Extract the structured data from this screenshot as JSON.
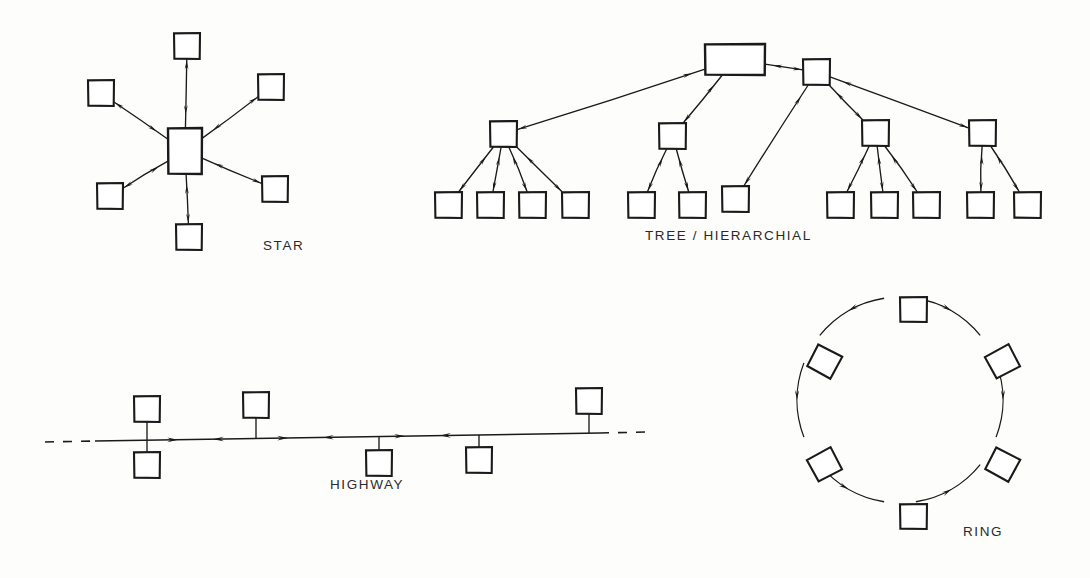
{
  "page": {
    "background_color": "#fdfdfc",
    "ink_color": "#1a1a1a",
    "width": 1090,
    "height": 578,
    "style": "hand-drawn technical line diagram, black ink on white"
  },
  "diagrams": [
    {
      "id": "star",
      "caption": "STAR",
      "caption_x": 263,
      "caption_y": 238,
      "hub": {
        "x": 168,
        "y": 128,
        "w": 34,
        "h": 46,
        "shape": "rectangle"
      },
      "spoke_count": 6,
      "link_style": "bidirectional",
      "nodes": [
        {
          "name": "star-node-top",
          "x": 174,
          "y": 33,
          "w": 26,
          "h": 26
        },
        {
          "name": "star-node-upper-left",
          "x": 88,
          "y": 80,
          "w": 26,
          "h": 26
        },
        {
          "name": "star-node-upper-right",
          "x": 258,
          "y": 74,
          "w": 26,
          "h": 26
        },
        {
          "name": "star-node-lower-left",
          "x": 97,
          "y": 183,
          "w": 26,
          "h": 26
        },
        {
          "name": "star-node-lower-right",
          "x": 262,
          "y": 176,
          "w": 26,
          "h": 26
        },
        {
          "name": "star-node-bottom",
          "x": 176,
          "y": 224,
          "w": 26,
          "h": 26
        }
      ]
    },
    {
      "id": "tree",
      "caption": "TREE / HIERARCHIAL",
      "caption_x": 645,
      "caption_y": 228,
      "link_style": "bidirectional",
      "root": {
        "name": "tree-root",
        "x": 705,
        "y": 44,
        "w": 60,
        "h": 31,
        "shape": "rectangle"
      },
      "subroot": {
        "name": "tree-subroot",
        "x": 803,
        "y": 59,
        "w": 27,
        "h": 26
      },
      "branches": [
        {
          "name": "tree-branch-1",
          "x": 490,
          "y": 121,
          "w": 27,
          "h": 26,
          "parent": "tree-root",
          "leaf_count": 4
        },
        {
          "name": "tree-branch-2",
          "x": 659,
          "y": 123,
          "w": 27,
          "h": 26,
          "parent": "tree-root",
          "leaf_count": 2
        },
        {
          "name": "tree-branch-3",
          "x": 862,
          "y": 120,
          "w": 27,
          "h": 26,
          "parent": "tree-subroot",
          "leaf_count": 3
        },
        {
          "name": "tree-branch-4",
          "x": 969,
          "y": 120,
          "w": 27,
          "h": 26,
          "parent": "tree-subroot",
          "leaf_count": 2
        }
      ],
      "direct_leaf": {
        "name": "tree-direct-leaf",
        "x": 722,
        "y": 186,
        "w": 27,
        "h": 26,
        "parent": "tree-subroot"
      },
      "leaves": [
        {
          "name": "tree-leaf-1",
          "x": 435,
          "y": 192,
          "w": 27,
          "h": 26,
          "parent": "tree-branch-1"
        },
        {
          "name": "tree-leaf-2",
          "x": 477,
          "y": 192,
          "w": 27,
          "h": 26,
          "parent": "tree-branch-1"
        },
        {
          "name": "tree-leaf-3",
          "x": 519,
          "y": 192,
          "w": 27,
          "h": 26,
          "parent": "tree-branch-1"
        },
        {
          "name": "tree-leaf-4",
          "x": 562,
          "y": 192,
          "w": 27,
          "h": 26,
          "parent": "tree-branch-1"
        },
        {
          "name": "tree-leaf-5",
          "x": 628,
          "y": 192,
          "w": 27,
          "h": 26,
          "parent": "tree-branch-2"
        },
        {
          "name": "tree-leaf-6",
          "x": 679,
          "y": 192,
          "w": 27,
          "h": 26,
          "parent": "tree-branch-2"
        },
        {
          "name": "tree-leaf-7",
          "x": 827,
          "y": 192,
          "w": 27,
          "h": 26,
          "parent": "tree-branch-3"
        },
        {
          "name": "tree-leaf-8",
          "x": 871,
          "y": 192,
          "w": 27,
          "h": 26,
          "parent": "tree-branch-3"
        },
        {
          "name": "tree-leaf-9",
          "x": 913,
          "y": 192,
          "w": 27,
          "h": 26,
          "parent": "tree-branch-3"
        },
        {
          "name": "tree-leaf-10",
          "x": 967,
          "y": 192,
          "w": 27,
          "h": 26,
          "parent": "tree-branch-4"
        },
        {
          "name": "tree-leaf-11",
          "x": 1014,
          "y": 192,
          "w": 27,
          "h": 26,
          "parent": "tree-branch-4"
        }
      ]
    },
    {
      "id": "highway",
      "caption": "HIGHWAY",
      "caption_x": 330,
      "caption_y": 477,
      "link_style": "bidirectional",
      "bus": {
        "x1": 95,
        "y1": 441,
        "x2": 600,
        "y2": 433
      },
      "dash_left": {
        "x1": 45,
        "y1": 442,
        "x2": 96,
        "y2": 441
      },
      "dash_right": {
        "x1": 600,
        "y1": 433,
        "x2": 648,
        "y2": 432
      },
      "taps": [
        {
          "name": "highway-node-1-above",
          "x": 134,
          "y": 396,
          "w": 26,
          "h": 26,
          "side": "above",
          "tap_x": 147
        },
        {
          "name": "highway-node-1-below",
          "x": 134,
          "y": 452,
          "w": 26,
          "h": 26,
          "side": "below",
          "tap_x": 147
        },
        {
          "name": "highway-node-2",
          "x": 243,
          "y": 392,
          "w": 26,
          "h": 26,
          "side": "above",
          "tap_x": 256
        },
        {
          "name": "highway-node-3",
          "x": 366,
          "y": 450,
          "w": 26,
          "h": 26,
          "side": "below",
          "tap_x": 379
        },
        {
          "name": "highway-node-4",
          "x": 466,
          "y": 447,
          "w": 26,
          "h": 26,
          "side": "below",
          "tap_x": 479
        },
        {
          "name": "highway-node-5",
          "x": 576,
          "y": 388,
          "w": 26,
          "h": 26,
          "side": "above",
          "tap_x": 589
        }
      ],
      "arrow_pairs": [
        {
          "x": 178,
          "dir": "right"
        },
        {
          "x": 213,
          "dir": "left"
        },
        {
          "x": 288,
          "dir": "right"
        },
        {
          "x": 323,
          "dir": "left"
        },
        {
          "x": 405,
          "dir": "right"
        },
        {
          "x": 440,
          "dir": "left"
        }
      ]
    },
    {
      "id": "ring",
      "caption": "RING",
      "caption_x": 963,
      "caption_y": 524,
      "link_style": "bidirectional",
      "center_x": 900,
      "center_y": 400,
      "radius": 103,
      "node_count": 6,
      "nodes": [
        {
          "name": "ring-node-top",
          "angle": -90,
          "x": 900,
          "y": 297,
          "w": 27,
          "h": 25,
          "rotation": 0
        },
        {
          "name": "ring-node-upper-right",
          "angle": -30,
          "x": 989,
          "y": 349,
          "w": 27,
          "h": 25,
          "rotation": -28
        },
        {
          "name": "ring-node-lower-right",
          "angle": 30,
          "x": 989,
          "y": 452,
          "w": 27,
          "h": 25,
          "rotation": 28
        },
        {
          "name": "ring-node-bottom",
          "angle": 90,
          "x": 900,
          "y": 504,
          "w": 27,
          "h": 25,
          "rotation": 0
        },
        {
          "name": "ring-node-lower-left",
          "angle": 150,
          "x": 811,
          "y": 452,
          "w": 27,
          "h": 25,
          "rotation": -28
        },
        {
          "name": "ring-node-upper-left",
          "angle": -150,
          "x": 811,
          "y": 349,
          "w": 27,
          "h": 25,
          "rotation": 28
        }
      ],
      "arc_directions": [
        "clockwise-right",
        "clockwise-down",
        "counterclockwise",
        "counterclockwise",
        "counterclockwise-up",
        "clockwise-top"
      ]
    }
  ]
}
